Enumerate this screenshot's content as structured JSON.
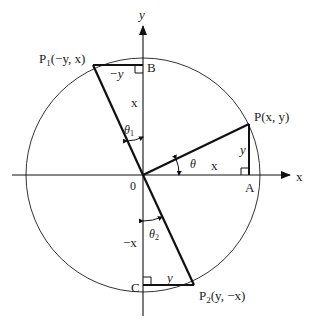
{
  "diagram": {
    "axes": {
      "x_label": "x",
      "y_label": "y",
      "origin_label": "0"
    },
    "points": {
      "P": {
        "label": "P(x, y)"
      },
      "P1": {
        "label_main": "P",
        "label_sub": "1",
        "label_rest": "(−y, x)"
      },
      "P2": {
        "label_main": "P",
        "label_sub": "2",
        "label_rest": "(y, −x)"
      },
      "A": {
        "label": "A"
      },
      "B": {
        "label": "B"
      },
      "C": {
        "label": "C"
      }
    },
    "segments": {
      "PA": "y",
      "OA": "x",
      "P1B": "−y",
      "OB": "x",
      "OC": "−x",
      "CP2": "y"
    },
    "angles": {
      "theta": {
        "symbol": "θ"
      },
      "theta1": {
        "symbol": "θ",
        "sub": "1"
      },
      "theta2": {
        "symbol": "θ",
        "sub": "2"
      }
    }
  }
}
